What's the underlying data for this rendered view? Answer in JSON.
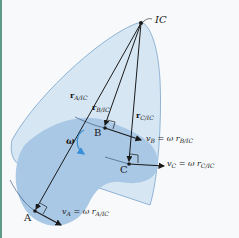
{
  "diagram": {
    "points": {
      "ic": {
        "label": "IC"
      },
      "a": {
        "label": "A"
      },
      "b": {
        "label": "B"
      },
      "c": {
        "label": "C"
      }
    },
    "position_vectors": {
      "r_a": {
        "symbol": "r",
        "subscript": "A/IC"
      },
      "r_b": {
        "symbol": "r",
        "subscript": "B/IC"
      },
      "r_c": {
        "symbol": "r",
        "subscript": "C/IC"
      }
    },
    "velocities": {
      "v_a": {
        "symbol": "v",
        "subscript": "A",
        "equation": " = ω r",
        "eq_subscript": "A/IC"
      },
      "v_b": {
        "symbol": "v",
        "subscript": "B",
        "equation": " = ω r",
        "eq_subscript": "B/IC"
      },
      "v_c": {
        "symbol": "v",
        "subscript": "C",
        "equation": " = ω r",
        "eq_subscript": "C/IC"
      }
    },
    "angular_velocity": {
      "symbol": "ω"
    },
    "colors": {
      "background": "#f7f9fb",
      "cone_fill": "#d6e6f3",
      "cone_stroke": "#7aa5cc",
      "body_fill": "#a9c8e6",
      "line": "#1a1a1a",
      "omega_arrow": "#3b8fd6",
      "left_edge": "#5e9a8a"
    }
  }
}
